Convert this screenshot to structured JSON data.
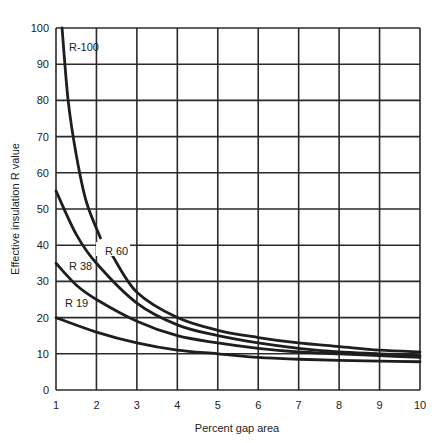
{
  "chart_data": {
    "type": "line",
    "title": "",
    "xlabel": "Percent gap area",
    "ylabel": "Effective insulation R value",
    "xlim": [
      1,
      10
    ],
    "ylim": [
      0,
      100
    ],
    "grid": true,
    "x_ticks": [
      "1",
      "2",
      "3",
      "4",
      "5",
      "6",
      "7",
      "8",
      "9",
      "10"
    ],
    "y_ticks": [
      "0",
      "10",
      "20",
      "30",
      "40",
      "50",
      "60",
      "70",
      "80",
      "90",
      "100"
    ],
    "legend": "inline labels",
    "series": [
      {
        "name": "R-100",
        "label": "R-100",
        "points": [
          [
            1.15,
            100
          ],
          [
            1.3,
            80
          ],
          [
            1.5,
            65
          ],
          [
            1.75,
            52
          ],
          [
            2.1,
            42
          ],
          [
            2.4,
            37
          ],
          [
            3,
            27
          ],
          [
            4,
            20
          ],
          [
            5,
            16.5
          ],
          [
            6,
            14.5
          ],
          [
            7,
            13
          ],
          [
            8,
            12
          ],
          [
            9,
            11
          ],
          [
            10,
            10.5
          ]
        ],
        "gap_after_index": 4
      },
      {
        "name": "R 60",
        "label": "R 60",
        "points": [
          [
            1,
            55
          ],
          [
            1.5,
            43
          ],
          [
            2,
            35
          ],
          [
            3,
            24
          ],
          [
            4,
            18
          ],
          [
            5,
            15
          ],
          [
            6,
            13
          ],
          [
            7,
            11.5
          ],
          [
            8,
            10.5
          ],
          [
            9,
            10
          ],
          [
            10,
            9.5
          ]
        ]
      },
      {
        "name": "R 38",
        "label": "R 38",
        "points": [
          [
            1,
            35
          ],
          [
            1.5,
            29
          ],
          [
            2,
            25
          ],
          [
            3,
            19
          ],
          [
            4,
            15
          ],
          [
            5,
            13
          ],
          [
            6,
            11.5
          ],
          [
            7,
            10.5
          ],
          [
            8,
            10
          ],
          [
            9,
            9.5
          ],
          [
            10,
            9
          ]
        ]
      },
      {
        "name": "R 19",
        "label": "R 19",
        "points": [
          [
            1,
            20
          ],
          [
            2,
            16
          ],
          [
            3,
            13
          ],
          [
            4,
            11
          ],
          [
            5,
            10
          ],
          [
            6,
            9
          ],
          [
            7,
            8.5
          ],
          [
            8,
            8.2
          ],
          [
            9,
            8
          ],
          [
            10,
            7.8
          ]
        ]
      }
    ]
  },
  "labels": {
    "xlabel": "Percent gap area",
    "ylabel": "Effective insulation R value",
    "r100": "R-100",
    "r60": "R 60",
    "r38": "R 38",
    "r19": "R 19"
  }
}
